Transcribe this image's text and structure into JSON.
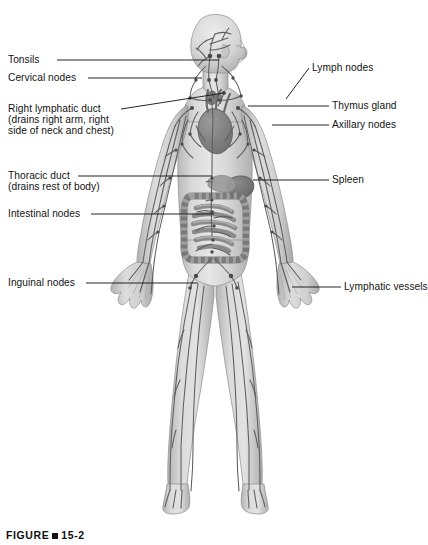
{
  "figure": {
    "caption_prefix": "FIGURE",
    "caption_number": "15-2",
    "background_color": "#ffffff",
    "body_fill": "#d2d2d2",
    "vessel_color": "#5d5d5d",
    "leader_color": "#1a1a1a",
    "text_color": "#141414"
  },
  "labels_left": [
    {
      "id": "tonsils",
      "text": "Tonsils",
      "x": 8,
      "y": 54,
      "leader": {
        "x1": 57,
        "y1": 60,
        "x2": 219,
        "y2": 60
      }
    },
    {
      "id": "cervical-nodes",
      "text": "Cervical nodes",
      "x": 8,
      "y": 72,
      "leader": {
        "x1": 88,
        "y1": 78,
        "x2": 202,
        "y2": 78
      }
    },
    {
      "id": "right-lymphatic-duct",
      "text": "Right lymphatic duct",
      "x": 8,
      "y": 103,
      "line2": "(drains right arm, right",
      "line3": "side of neck and chest)",
      "leader": {
        "x1": 121,
        "y1": 109,
        "x2": 224,
        "y2": 93
      }
    },
    {
      "id": "thoracic-duct",
      "text": "Thoracic duct",
      "x": 8,
      "y": 170,
      "line2": "(drains rest of body)",
      "leader": {
        "x1": 78,
        "y1": 176,
        "x2": 212,
        "y2": 176
      }
    },
    {
      "id": "intestinal-nodes",
      "text": "Intestinal nodes",
      "x": 8,
      "y": 208,
      "leader": {
        "x1": 91,
        "y1": 214,
        "x2": 214,
        "y2": 214
      }
    },
    {
      "id": "inguinal-nodes",
      "text": "Inguinal nodes",
      "x": 8,
      "y": 277,
      "leader": {
        "x1": 86,
        "y1": 283,
        "x2": 198,
        "y2": 283
      }
    }
  ],
  "labels_right": [
    {
      "id": "lymph-nodes",
      "text": "Lymph nodes",
      "x": 312,
      "y": 62,
      "leader": {
        "x1": 286,
        "y1": 99,
        "x2": 309,
        "y2": 68
      }
    },
    {
      "id": "thymus-gland",
      "text": "Thymus gland",
      "x": 332,
      "y": 100,
      "leader": {
        "x1": 248,
        "y1": 106,
        "x2": 329,
        "y2": 106
      }
    },
    {
      "id": "axillary-nodes",
      "text": "Axillary nodes",
      "x": 332,
      "y": 119,
      "leader": {
        "x1": 272,
        "y1": 125,
        "x2": 329,
        "y2": 125
      }
    },
    {
      "id": "spleen",
      "text": "Spleen",
      "x": 332,
      "y": 174,
      "leader": {
        "x1": 253,
        "y1": 180,
        "x2": 329,
        "y2": 180
      }
    },
    {
      "id": "lymphatic-vessels",
      "text": "Lymphatic vessels",
      "x": 344,
      "y": 281,
      "leader": {
        "x1": 292,
        "y1": 287,
        "x2": 341,
        "y2": 287
      }
    }
  ],
  "anatomy_parts": [
    "head",
    "face-profile",
    "neck",
    "shoulders",
    "torso",
    "heart",
    "thymus",
    "spleen",
    "small-intestine",
    "large-intestine",
    "pelvis",
    "left-arm",
    "right-arm",
    "left-hand",
    "right-hand",
    "left-leg",
    "right-leg",
    "left-foot",
    "right-foot",
    "lymphatic-vessel-network",
    "lymph-node-cluster"
  ]
}
